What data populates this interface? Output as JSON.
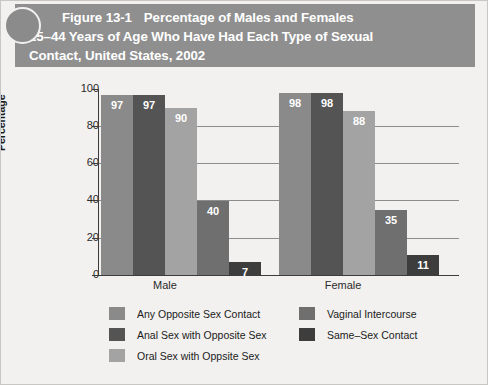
{
  "figure": {
    "number": "Figure 13-1",
    "title_lines": [
      "Percentage of Males and Females",
      "25–44 Years of Age Who Have Had Each Type of Sexual",
      "Contact, United States, 2002"
    ],
    "header_bg": "#8f8f8f",
    "header_text_color": "#ffffff"
  },
  "chart_data": {
    "type": "bar",
    "xlabel": "",
    "ylabel": "Percentage",
    "ylim": [
      0,
      100
    ],
    "yticks": [
      0,
      20,
      40,
      60,
      80,
      100
    ],
    "grid": true,
    "legend_position": "bottom",
    "categories": [
      "Male",
      "Female"
    ],
    "series": [
      {
        "name": "Any Opposite Sex Contact",
        "color": "#8a8a8a",
        "values": [
          97,
          98
        ]
      },
      {
        "name": "Anal Sex with Opposite Sex",
        "color": "#545454",
        "values": [
          97,
          98
        ]
      },
      {
        "name": "Oral Sex with Oppsite Sex",
        "color": "#a3a3a3",
        "values": [
          90,
          88
        ]
      },
      {
        "name": "Vaginal Intercourse",
        "color": "#6f6f6f",
        "values": [
          40,
          35
        ]
      },
      {
        "name": "Same–Sex Contact",
        "color": "#3d3d3d",
        "values": [
          7,
          11
        ]
      }
    ]
  },
  "axis": {
    "ytick_labels": [
      "100",
      "80",
      "60",
      "40",
      "20",
      "0"
    ],
    "ylabel": "Percentage",
    "category_labels": [
      "Male",
      "Female"
    ]
  },
  "legend": {
    "left_column": [
      {
        "label": "Any Opposite Sex Contact",
        "color": "#8a8a8a"
      },
      {
        "label": "Anal Sex with Opposite Sex",
        "color": "#545454"
      },
      {
        "label": "Oral Sex with Oppsite Sex",
        "color": "#a3a3a3"
      }
    ],
    "right_column": [
      {
        "label": "Vaginal Intercourse",
        "color": "#6f6f6f"
      },
      {
        "label": "Same–Sex Contact",
        "color": "#3d3d3d"
      }
    ]
  }
}
